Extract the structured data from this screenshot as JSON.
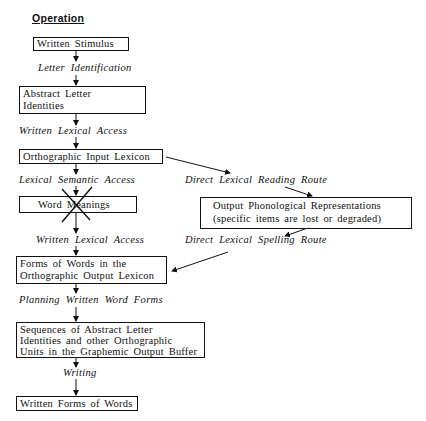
{
  "title": "Operation",
  "boxes": {
    "written_stimulus": "Written  Stimulus",
    "abstract_letter_1": "Abstract  Letter",
    "abstract_letter_2": "Identities",
    "ortho_input": "Orthographic  Input  Lexicon",
    "word_meanings": "Word  Meanings",
    "phon_1": "Output  Phonological  Representations",
    "phon_2": "(specific  items  are  lost  or  degraded)",
    "forms_1": "Forms  of  Words  in  the",
    "forms_2": "Orthographic  Output  Lexicon",
    "seq_1": "Sequences  of  Abstract  Letter",
    "seq_2": "Identities  and  other  Orthographic",
    "seq_3": "Units  in  the  Graphemic  Output  Buffer",
    "written_forms": "Written  Forms  of  Words"
  },
  "labels": {
    "letter_identification": "Letter  Identification",
    "written_lexical_access_1": "Written  Lexical  Access",
    "lexical_semantic_access": "Lexical  Semantic  Access",
    "direct_lexical_reading": "Direct  Lexical  Reading  Route",
    "written_lexical_access_2": "Written  Lexical  Access",
    "direct_lexical_spelling": "Direct  Lexical  Spelling  Route",
    "planning": "Planning  Written  Word  Forms",
    "writing": "Writing"
  },
  "annotations": {
    "word_meanings_crossed_out": true
  }
}
